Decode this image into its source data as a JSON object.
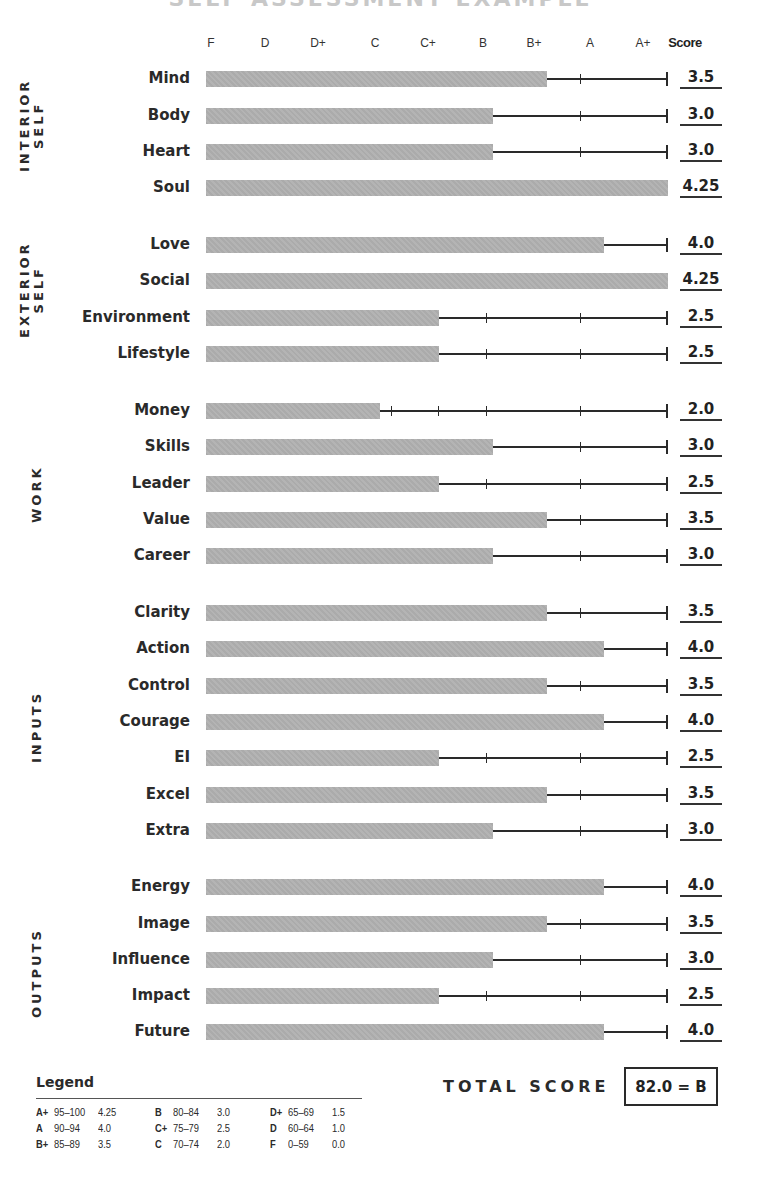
{
  "title": "SELF ASSESSMENT EXAMPLE",
  "header": {
    "grades": [
      {
        "label": "F",
        "x": 211
      },
      {
        "label": "D",
        "x": 265
      },
      {
        "label": "D+",
        "x": 318
      },
      {
        "label": "C",
        "x": 375
      },
      {
        "label": "C+",
        "x": 428
      },
      {
        "label": "B",
        "x": 483
      },
      {
        "label": "B+",
        "x": 534
      },
      {
        "label": "A",
        "x": 590
      },
      {
        "label": "A+",
        "x": 643
      }
    ],
    "score_label": "Score"
  },
  "scale": {
    "bar_start_x": 206,
    "track_end_x": 667,
    "tick_x": [
      391,
      438,
      486,
      580
    ],
    "value_to_x": {
      "2.0": 380,
      "2.5": 439,
      "3.0": 493,
      "3.5": 547,
      "4.0": 604,
      "4.25": 668
    }
  },
  "chart_data": {
    "type": "bar",
    "orientation": "horizontal",
    "title": "SELF ASSESSMENT EXAMPLE",
    "xlabel": "Grade",
    "x_tick_labels": [
      "F",
      "D",
      "D+",
      "C",
      "C+",
      "B",
      "B+",
      "A",
      "A+"
    ],
    "xlim": [
      0,
      4.25
    ],
    "groups": [
      {
        "name": "INTERIOR SELF",
        "label_lines": [
          "INTERIOR",
          "SELF"
        ],
        "items": [
          {
            "name": "Mind",
            "score": "3.5",
            "y": 79
          },
          {
            "name": "Body",
            "score": "3.0",
            "y": 116
          },
          {
            "name": "Heart",
            "score": "3.0",
            "y": 152
          },
          {
            "name": "Soul",
            "score": "4.25",
            "y": 188
          }
        ]
      },
      {
        "name": "EXTERIOR SELF",
        "label_lines": [
          "EXTERIOR",
          "SELF"
        ],
        "items": [
          {
            "name": "Love",
            "score": "4.0",
            "y": 245
          },
          {
            "name": "Social",
            "score": "4.25",
            "y": 281
          },
          {
            "name": "Environment",
            "score": "2.5",
            "y": 318
          },
          {
            "name": "Lifestyle",
            "score": "2.5",
            "y": 354
          }
        ]
      },
      {
        "name": "WORK",
        "label_lines": [
          "WORK"
        ],
        "items": [
          {
            "name": "Money",
            "score": "2.0",
            "y": 411
          },
          {
            "name": "Skills",
            "score": "3.0",
            "y": 447
          },
          {
            "name": "Leader",
            "score": "2.5",
            "y": 484
          },
          {
            "name": "Value",
            "score": "3.5",
            "y": 520
          },
          {
            "name": "Career",
            "score": "3.0",
            "y": 556
          }
        ]
      },
      {
        "name": "INPUTS",
        "label_lines": [
          "INPUTS"
        ],
        "items": [
          {
            "name": "Clarity",
            "score": "3.5",
            "y": 613
          },
          {
            "name": "Action",
            "score": "4.0",
            "y": 649
          },
          {
            "name": "Control",
            "score": "3.5",
            "y": 686
          },
          {
            "name": "Courage",
            "score": "4.0",
            "y": 722
          },
          {
            "name": "EI",
            "score": "2.5",
            "y": 758
          },
          {
            "name": "Excel",
            "score": "3.5",
            "y": 795
          },
          {
            "name": "Extra",
            "score": "3.0",
            "y": 831
          }
        ]
      },
      {
        "name": "OUTPUTS",
        "label_lines": [
          "OUTPUTS"
        ],
        "items": [
          {
            "name": "Energy",
            "score": "4.0",
            "y": 887
          },
          {
            "name": "Image",
            "score": "3.5",
            "y": 924
          },
          {
            "name": "Influence",
            "score": "3.0",
            "y": 960
          },
          {
            "name": "Impact",
            "score": "2.5",
            "y": 996
          },
          {
            "name": "Future",
            "score": "4.0",
            "y": 1032
          }
        ]
      }
    ]
  },
  "group_label_positions": [
    {
      "x": 18,
      "y": 172,
      "lines": 2
    },
    {
      "x": 18,
      "y": 338,
      "lines": 2
    },
    {
      "x": 30,
      "y": 523,
      "lines": 1
    },
    {
      "x": 30,
      "y": 763,
      "lines": 1
    },
    {
      "x": 30,
      "y": 1018,
      "lines": 1
    }
  ],
  "legend": {
    "title": "Legend",
    "columns": [
      {
        "x": 36,
        "rows": [
          {
            "grade": "A+",
            "range": "95–100",
            "points": "4.25"
          },
          {
            "grade": "A",
            "range": "90–94",
            "points": "4.0"
          },
          {
            "grade": "B+",
            "range": "85–89",
            "points": "3.5"
          }
        ]
      },
      {
        "x": 155,
        "rows": [
          {
            "grade": "B",
            "range": "80–84",
            "points": "3.0"
          },
          {
            "grade": "C+",
            "range": "75–79",
            "points": "2.5"
          },
          {
            "grade": "C",
            "range": "70–74",
            "points": "2.0"
          }
        ]
      },
      {
        "x": 270,
        "rows": [
          {
            "grade": "D+",
            "range": "65–69",
            "points": "1.5"
          },
          {
            "grade": "D",
            "range": "60–64",
            "points": "1.0"
          },
          {
            "grade": "F",
            "range": "0–59",
            "points": "0.0"
          }
        ]
      }
    ]
  },
  "total": {
    "label": "TOTAL SCORE",
    "value": "82.0 = B"
  }
}
